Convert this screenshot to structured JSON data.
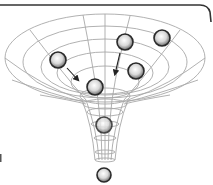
{
  "diagram": {
    "title": "",
    "colors": {
      "grid": "#a8a8a8",
      "frame": "#333333",
      "arrow": "#222222",
      "sphere_edge": "#2a2a2a",
      "sphere_highlight": "#ffffff",
      "sphere_shade": "#8a8a8a"
    },
    "spheres": [
      {
        "id": "sphere-upper-left",
        "cx": 58,
        "cy": 60,
        "r": 8
      },
      {
        "id": "sphere-upper-mid",
        "cx": 125,
        "cy": 42,
        "r": 8
      },
      {
        "id": "sphere-upper-right",
        "cx": 162,
        "cy": 38,
        "r": 8
      },
      {
        "id": "sphere-mid-right",
        "cx": 136,
        "cy": 71,
        "r": 8
      },
      {
        "id": "sphere-center",
        "cx": 95,
        "cy": 87,
        "r": 8
      },
      {
        "id": "sphere-in-throat",
        "cx": 104,
        "cy": 125,
        "r": 8
      },
      {
        "id": "sphere-below-funnel",
        "cx": 104,
        "cy": 175,
        "r": 7
      }
    ],
    "arrows": [
      {
        "id": "arrow-left",
        "x1": 67,
        "y1": 68,
        "x2": 78,
        "y2": 80
      },
      {
        "id": "arrow-right",
        "x1": 120,
        "y1": 53,
        "x2": 115,
        "y2": 74
      }
    ]
  }
}
